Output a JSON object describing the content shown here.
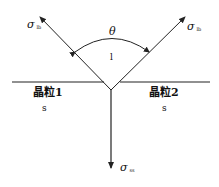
{
  "diagram": {
    "type": "grain-boundary-wetting-diagram",
    "angle_label": "θ",
    "liquid_label": "l",
    "left_grain": {
      "name": "晶粒1",
      "phase": "s"
    },
    "right_grain": {
      "name": "晶粒2",
      "phase": "s"
    },
    "tension_left": {
      "symbol": "σ",
      "subscript": "lb"
    },
    "tension_right": {
      "symbol": "σ",
      "subscript": "lb"
    },
    "tension_down": {
      "symbol": "σ",
      "subscript": "ss"
    },
    "colors": {
      "line": "#222222",
      "background": "#ffffff"
    }
  }
}
